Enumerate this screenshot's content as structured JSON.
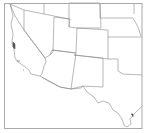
{
  "map": {
    "title": "",
    "region": "Southwestern United States",
    "colors": {
      "background": "#ffffff",
      "border": "#888888",
      "frame": "#a0a0a0",
      "water": "#555555"
    },
    "states": [
      {
        "name": "California",
        "path": "M10,4 L13,16 L11,24 L13,34 L12,42 L14,50 L15,58 L18,62 L24,66 L29,70 L31,74 L40,76 L42,74 L44,66 L46,62 L45,58 L24,30 L15,16 L10,4"
      },
      {
        "name": "Nevada",
        "path": "M24,10 L24,30 L45,58 L50,55 L53,52 L54,17"
      },
      {
        "name": "Oregon-Idaho top",
        "path": "M10,4 L24,10 L44,14 L69,19"
      },
      {
        "name": "Arizona",
        "path": "M50,55 L52,50 L76,53 L71,89 L60,87 L42,77"
      },
      {
        "name": "Utah",
        "path": "M54,17 L70,19 L69,27 L77,28 L76,53 L52,50"
      },
      {
        "name": "Idaho-Wyoming",
        "path": "M44,3 L44,14 M69,3 L69,27"
      },
      {
        "name": "Wyoming",
        "path": "M69,3 L100,3 L101,28 L77,28"
      },
      {
        "name": "Colorado",
        "path": "M77,28 L108,30 L108,59 L74,55"
      },
      {
        "name": "New Mexico",
        "path": "M74,55 L103,58 L103,87 L83,86 L81,88 L71,89"
      },
      {
        "name": "Nebraska",
        "path": "M100,3 L100,18 L133,18 L138,27 L141,36"
      },
      {
        "name": "South Dakota",
        "path": "M100,3 L100,3 M134,3 L134,14"
      },
      {
        "name": "Kansas",
        "path": "M108,37 L142,37"
      },
      {
        "name": "Oklahoma",
        "path": "M108,59 L118,59 L118,71 L123,74 L142,75"
      },
      {
        "name": "Texas",
        "path": "M83,86 L87,92 L94,97 L98,103 L103,101 L109,103 L113,110 L118,113 L122,119 L124,125 L127,127 L131,124 L130,119 L135,113 L140,108 L142,106"
      },
      {
        "name": "Mexico border",
        "path": "M40,76 L48,81 L60,87 L71,89 L83,86"
      }
    ],
    "islands": [
      {
        "name": "San Francisco Bay",
        "path": "M13,42 L15,44 L15,49 L13,47 Z"
      },
      {
        "name": "Channel Islands",
        "path": "M17,61 L20,61 M23,70 L24,70"
      },
      {
        "name": "Galveston Bay",
        "path": "M131,114 L133,114 L133,117"
      }
    ]
  }
}
